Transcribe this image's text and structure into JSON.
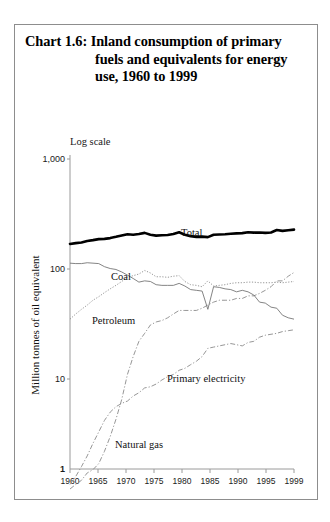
{
  "title": {
    "lead": "Chart 1.6:",
    "line1": " Inland consumption of primary",
    "line2": "fuels and equivalents for energy",
    "line3": "use, 1960 to 1999"
  },
  "scale_note": "Log scale",
  "axis": {
    "ylabel": "Million tonnes of oil equivalent",
    "yticks": [
      "1,000",
      "100",
      "10",
      "1"
    ],
    "xticks": [
      "1960",
      "1965",
      "1970",
      "1975",
      "1980",
      "1985",
      "1990",
      "1995",
      "1999"
    ]
  },
  "series_labels": {
    "total": "Total",
    "coal": "Coal",
    "petroleum": "Petroleum",
    "gas": "Natural gas",
    "electricity": "Primary electricity"
  },
  "chart_data": {
    "type": "line",
    "title": "Chart 1.6: Inland consumption of primary fuels and equivalents for energy use, 1960 to 1999",
    "xlabel": "",
    "ylabel": "Million tonnes of oil equivalent",
    "yscale": "log",
    "ylim": [
      1,
      1000
    ],
    "ytick_values": [
      1,
      10,
      100,
      1000
    ],
    "xlim": [
      1960,
      1999
    ],
    "xtick_values": [
      1960,
      1965,
      1970,
      1975,
      1980,
      1985,
      1990,
      1995,
      1999
    ],
    "grid": false,
    "legend": "inline-annotations",
    "x": [
      1960,
      1961,
      1962,
      1963,
      1964,
      1965,
      1966,
      1967,
      1968,
      1969,
      1970,
      1971,
      1972,
      1973,
      1974,
      1975,
      1976,
      1977,
      1978,
      1979,
      1980,
      1981,
      1982,
      1983,
      1984,
      1985,
      1986,
      1987,
      1988,
      1989,
      1990,
      1991,
      1992,
      1993,
      1994,
      1995,
      1996,
      1997,
      1998,
      1999
    ],
    "series": [
      {
        "name": "Total",
        "style": "thick-solid",
        "values": [
          169,
          172,
          174,
          180,
          183,
          187,
          188,
          191,
          196,
          202,
          207,
          205,
          208,
          213,
          205,
          201,
          203,
          204,
          208,
          216,
          205,
          199,
          196,
          197,
          195,
          205,
          206,
          207,
          209,
          211,
          212,
          216,
          214,
          215,
          213,
          215,
          226,
          222,
          225,
          228
        ]
      },
      {
        "name": "Coal",
        "style": "thin-solid",
        "values": [
          113,
          112,
          112,
          114,
          113,
          112,
          105,
          101,
          99,
          94,
          88,
          82,
          76,
          78,
          77,
          72,
          71,
          71,
          71,
          74,
          70,
          65,
          64,
          63,
          43,
          69,
          68,
          66,
          65,
          62,
          64,
          62,
          58,
          50,
          49,
          45,
          44,
          38,
          36,
          35
        ]
      },
      {
        "name": "Petroleum",
        "style": "dotted",
        "values": [
          35,
          39,
          43,
          47,
          52,
          56,
          61,
          66,
          71,
          77,
          84,
          87,
          90,
          97,
          92,
          85,
          85,
          84,
          86,
          87,
          77,
          72,
          71,
          69,
          78,
          70,
          71,
          72,
          74,
          75,
          75,
          76,
          76,
          75,
          75,
          75,
          76,
          75,
          76,
          77
        ]
      },
      {
        "name": "Natural gas",
        "style": "dash-dot",
        "values": [
          1.0,
          1.1,
          1.2,
          1.4,
          1.5,
          1.7,
          2.2,
          3.0,
          4.3,
          6.5,
          11,
          16,
          22,
          26,
          31,
          33,
          34,
          36,
          39,
          42,
          42,
          42,
          42,
          44,
          47,
          50,
          52,
          52,
          52,
          54,
          54,
          57,
          57,
          60,
          64,
          69,
          78,
          78,
          86,
          93
        ]
      },
      {
        "name": "Primary electricity",
        "style": "dash-dot",
        "values": [
          1.1,
          1.3,
          1.6,
          2.0,
          2.6,
          3.3,
          4.2,
          5.0,
          5.6,
          6.0,
          6.3,
          7.0,
          7.5,
          8.3,
          8.5,
          9.0,
          9.8,
          10.5,
          11.0,
          12.0,
          12.5,
          13.5,
          14.5,
          16.0,
          19.0,
          19.5,
          20.0,
          20.5,
          21.0,
          20.5,
          20.0,
          21.5,
          22.0,
          24.0,
          25.0,
          25.5,
          26.0,
          27.0,
          27.5,
          28.0
        ]
      }
    ]
  }
}
